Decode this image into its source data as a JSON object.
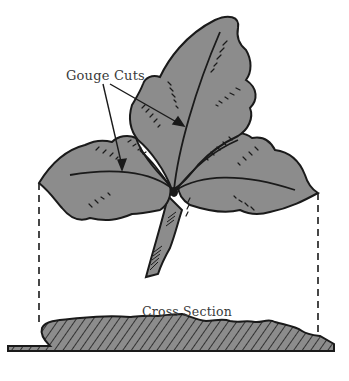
{
  "figure": {
    "labels": {
      "gouge_cuts": "Gouge Cuts",
      "cross_section": "Cross Section"
    },
    "caption_partial": "",
    "colors": {
      "leaf_fill": "#8c8c8c",
      "outline": "#1a1a1a",
      "background": "#ffffff",
      "label_text": "#3a3a3a"
    },
    "parts": [
      "leaf",
      "stem",
      "gouge-cuts",
      "projection-lines",
      "cross-section-profile",
      "hatching"
    ]
  }
}
